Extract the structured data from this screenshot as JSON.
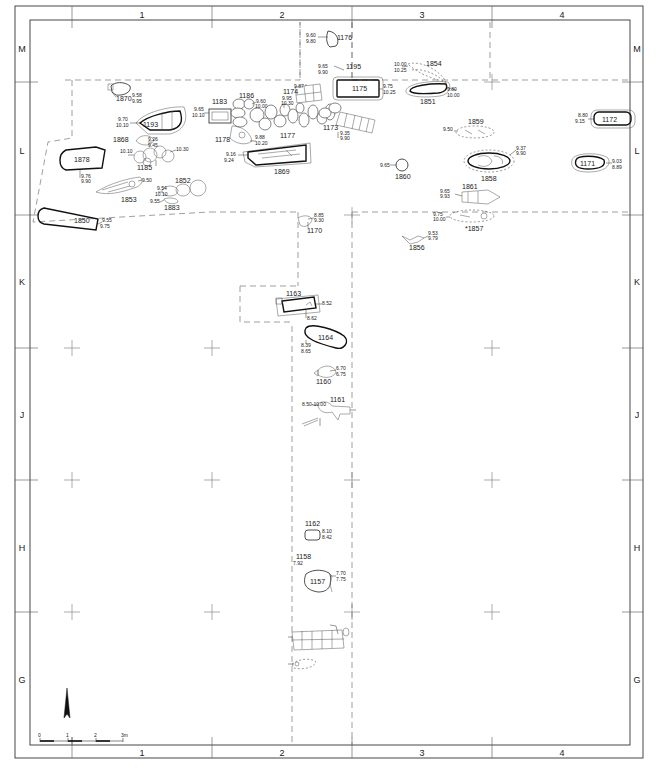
{
  "plan": {
    "column_labels": [
      "1",
      "2",
      "3",
      "4"
    ],
    "row_labels": [
      "M",
      "L",
      "K",
      "J",
      "H",
      "G"
    ],
    "scale_bar": {
      "ticks": [
        "0",
        "1",
        "2",
        "3m"
      ]
    },
    "north_arrow": "north-arrow"
  },
  "features": [
    {
      "id": "1176",
      "elev": [
        "9.60",
        "9.80"
      ]
    },
    {
      "id": "1195",
      "elev": [
        "9.65",
        "9.90"
      ]
    },
    {
      "id": "1175",
      "elev": [
        "9.75",
        "10.25"
      ]
    },
    {
      "id": "1854",
      "elev": [
        "10.00",
        "10.25"
      ]
    },
    {
      "id": "1851",
      "elev": [
        "9.80",
        "10.00"
      ]
    },
    {
      "id": "1870",
      "elev": [
        "9.58",
        "9.95"
      ]
    },
    {
      "id": "1183",
      "elev": [
        "9.65",
        "10.10"
      ]
    },
    {
      "id": "1186",
      "elev": [
        "9.60",
        "10.00"
      ]
    },
    {
      "id": "1174",
      "elev": [
        "9.87"
      ]
    },
    {
      "id": "1177",
      "elev": [
        "9.95",
        "10.30"
      ]
    },
    {
      "id": "1173",
      "elev": [
        "9.35",
        "9.90"
      ]
    },
    {
      "id": "1193",
      "elev": [
        "9.70",
        "10.10"
      ]
    },
    {
      "id": "1868",
      "elev": [
        "9.26",
        "9.45"
      ]
    },
    {
      "id": "1185",
      "elev": [
        "10.10",
        "10.30"
      ]
    },
    {
      "id": "1178",
      "elev": [
        "9.88",
        "10.20"
      ]
    },
    {
      "id": "1869",
      "elev": [
        "9.16",
        "9.24",
        "9.53"
      ]
    },
    {
      "id": "1873",
      "elev": [
        "9.53",
        "9.55",
        "9.96"
      ]
    },
    {
      "id": "1852",
      "elev": [
        "9.54",
        "10.10"
      ]
    },
    {
      "id": "1878",
      "elev": [
        "9.76",
        "9.90"
      ]
    },
    {
      "id": "1853",
      "elev": [
        "9.50"
      ]
    },
    {
      "id": "1883",
      "elev": [
        "9.55",
        "10.05"
      ]
    },
    {
      "id": "1850",
      "elev": [
        "9.55",
        "9.75"
      ]
    },
    {
      "id": "1855",
      "elev": [
        "9.45",
        "9.65"
      ]
    },
    {
      "id": "1859",
      "elev": [
        "9.50"
      ]
    },
    {
      "id": "1858",
      "elev": [
        "9.37",
        "9.90"
      ]
    },
    {
      "id": "1860",
      "elev": [
        "9.65",
        "9.95"
      ]
    },
    {
      "id": "1861",
      "elev": [
        "9.65",
        "9.93"
      ]
    },
    {
      "id": "*1857",
      "elev": [
        "9.75",
        "10.00"
      ]
    },
    {
      "id": "1856",
      "elev": [
        "9.53",
        "9.79"
      ]
    },
    {
      "id": "1172",
      "elev": [
        "8.80",
        "9.15"
      ]
    },
    {
      "id": "1171",
      "elev": [
        "9.03",
        "8.89"
      ]
    },
    {
      "id": "1170",
      "elev": [
        "8.85",
        "9.30"
      ]
    },
    {
      "id": "1163",
      "elev": [
        "8.52",
        "8.62"
      ]
    },
    {
      "id": "1164",
      "elev": [
        "8.39",
        "8.65",
        "8.49",
        "8.46"
      ]
    },
    {
      "id": "1160",
      "elev": [
        "6.70",
        "6.75"
      ]
    },
    {
      "id": "1161",
      "elev": [
        "8.50-10.00"
      ]
    },
    {
      "id": "1162",
      "elev": [
        "8.10",
        "8.42"
      ]
    },
    {
      "id": "1158",
      "elev": [
        "7.92",
        "8.15",
        "7.94",
        "8.15"
      ]
    },
    {
      "id": "1157",
      "elev": [
        "7.70",
        "7.75"
      ]
    }
  ]
}
